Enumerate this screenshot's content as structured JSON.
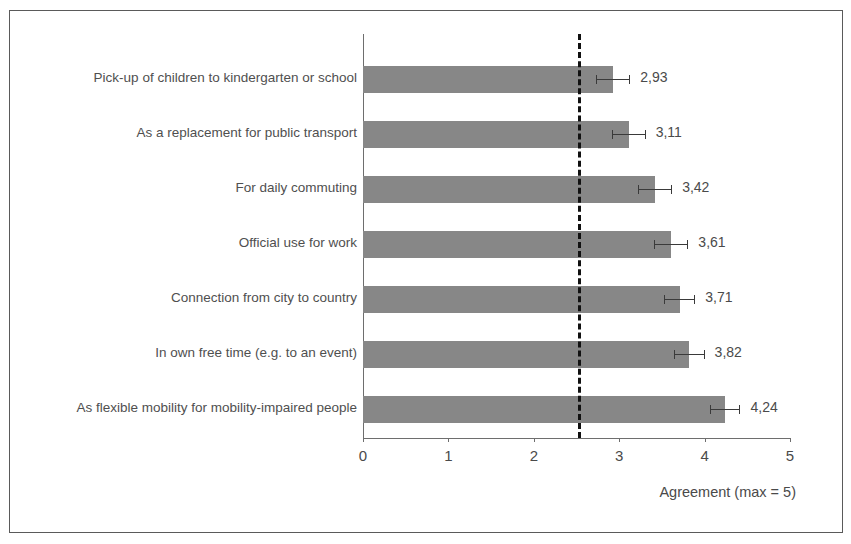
{
  "chart_data": {
    "type": "bar",
    "orientation": "horizontal",
    "title": "",
    "xlabel": "Agreement (max = 5)",
    "ylabel": "",
    "xlim": [
      0,
      5
    ],
    "xticks": [
      "0",
      "1",
      "2",
      "3",
      "4",
      "5"
    ],
    "grid": false,
    "legend": "none",
    "bar_color": "#878787",
    "categories": [
      "Pick-up of children to kindergarten or school",
      "As a replacement for public transport",
      "For daily commuting",
      "Official use for work",
      "Connection from city to country",
      "In own free time (e.g. to an event)",
      "As flexible mobility for mobility-impaired people"
    ],
    "values": [
      2.93,
      3.11,
      3.42,
      3.61,
      3.71,
      3.82,
      4.24
    ],
    "value_labels": [
      "2,93",
      "3,11",
      "3,42",
      "3,61",
      "3,71",
      "3,82",
      "4,24"
    ],
    "error_low": [
      0.2,
      0.2,
      0.2,
      0.2,
      0.18,
      0.18,
      0.18
    ],
    "error_high": [
      0.2,
      0.2,
      0.2,
      0.2,
      0.18,
      0.18,
      0.18
    ],
    "annotations": [
      {
        "name": "threshold-line",
        "type": "vertical-dashed-line",
        "value": 2.52,
        "color": "#111111"
      }
    ]
  }
}
